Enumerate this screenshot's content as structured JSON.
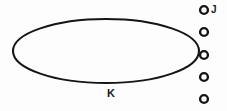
{
  "figure": {
    "background_color": "#fdfdfd",
    "stroke_color": "#151515",
    "width": 227,
    "height": 111,
    "ellipse": {
      "name": "large-ellipse",
      "label": "K",
      "cx": 106,
      "cy": 51,
      "rx": 93,
      "ry": 32,
      "stroke_width": 2.1,
      "fill": "none"
    },
    "ellipse_label": {
      "text": "K",
      "x": 111,
      "y": 97,
      "font_size": 11
    },
    "circle_column": {
      "name": "small-circle-column",
      "count": 5,
      "cx": 204,
      "radius": 3.9,
      "stroke_width": 2.4,
      "fill": "none",
      "circles": [
        {
          "label": "J",
          "cy": 10
        },
        {
          "label": "",
          "cy": 32
        },
        {
          "label": "",
          "cy": 55
        },
        {
          "label": "",
          "cy": 77
        },
        {
          "label": "",
          "cy": 99
        }
      ]
    },
    "circle_label": {
      "text": "J",
      "x": 211,
      "y": 13,
      "font_size": 10
    }
  }
}
